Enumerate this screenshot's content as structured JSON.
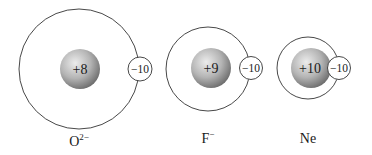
{
  "species": [
    {
      "id": "o2minus",
      "label": "O",
      "superscript": "2−",
      "nuclear_charge": "+8",
      "electron_charge": "−10",
      "orbit": {
        "cx": 79,
        "cy": 69,
        "r": 60
      },
      "nucleus": {
        "cx": 80,
        "cy": 69,
        "r": 20
      },
      "electron": {
        "cx": 140,
        "cy": 69,
        "r": 12
      },
      "label_pos": {
        "x": 79,
        "y": 146
      }
    },
    {
      "id": "fminus",
      "label": "F",
      "superscript": "−",
      "nuclear_charge": "+9",
      "electron_charge": "−10",
      "orbit": {
        "cx": 208,
        "cy": 69,
        "r": 42
      },
      "nucleus": {
        "cx": 211,
        "cy": 68,
        "r": 20
      },
      "electron": {
        "cx": 251,
        "cy": 68,
        "r": 11
      },
      "label_pos": {
        "x": 208,
        "y": 143
      }
    },
    {
      "id": "ne",
      "label": "Ne",
      "superscript": "",
      "nuclear_charge": "+10",
      "electron_charge": "−10",
      "orbit": {
        "cx": 308,
        "cy": 68,
        "r": 31
      },
      "nucleus": {
        "cx": 311,
        "cy": 68,
        "r": 20
      },
      "electron": {
        "cx": 339,
        "cy": 68,
        "r": 11
      },
      "label_pos": {
        "x": 308,
        "y": 143
      }
    }
  ],
  "colors": {
    "orbit": "#333333",
    "nucleus_light": "#e6e6e6",
    "nucleus_dark": "#6e6e6e",
    "text": "#1a1a1a"
  }
}
